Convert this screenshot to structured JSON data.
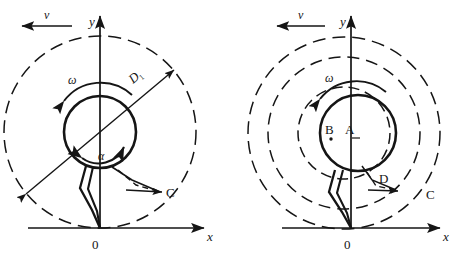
{
  "figure": {
    "panels": [
      {
        "id": "left",
        "name": "left-panel",
        "axis": {
          "y_label": "y",
          "x_label": "x",
          "origin_label": "0"
        },
        "labels": {
          "velocity": "v",
          "omega": "ω",
          "alpha": "α",
          "diameter": "D",
          "diameter_subscript": "1",
          "point_c": "C"
        },
        "geometry": {
          "origin": [
            100,
            228
          ],
          "center": [
            100,
            132
          ],
          "solid_circle_radius": 36,
          "dashed_circle_radius": 96,
          "diameter_line_angle_deg": 40
        }
      },
      {
        "id": "right",
        "name": "right-panel",
        "axis": {
          "y_label": "y",
          "x_label": "x",
          "origin_label": "0"
        },
        "labels": {
          "velocity": "v",
          "omega": "ω",
          "point_a": "A",
          "point_b": "B",
          "point_c": "C",
          "point_d": "D"
        },
        "geometry": {
          "origin": [
            351,
            228
          ],
          "solid_center": [
            358,
            133
          ],
          "solid_circle_radius": 38,
          "dashed_center": [
            344,
            133
          ],
          "dashed_radii": [
            46,
            76,
            96
          ]
        }
      }
    ],
    "colors": {
      "stroke": "#151515",
      "background": "#ffffff"
    }
  }
}
